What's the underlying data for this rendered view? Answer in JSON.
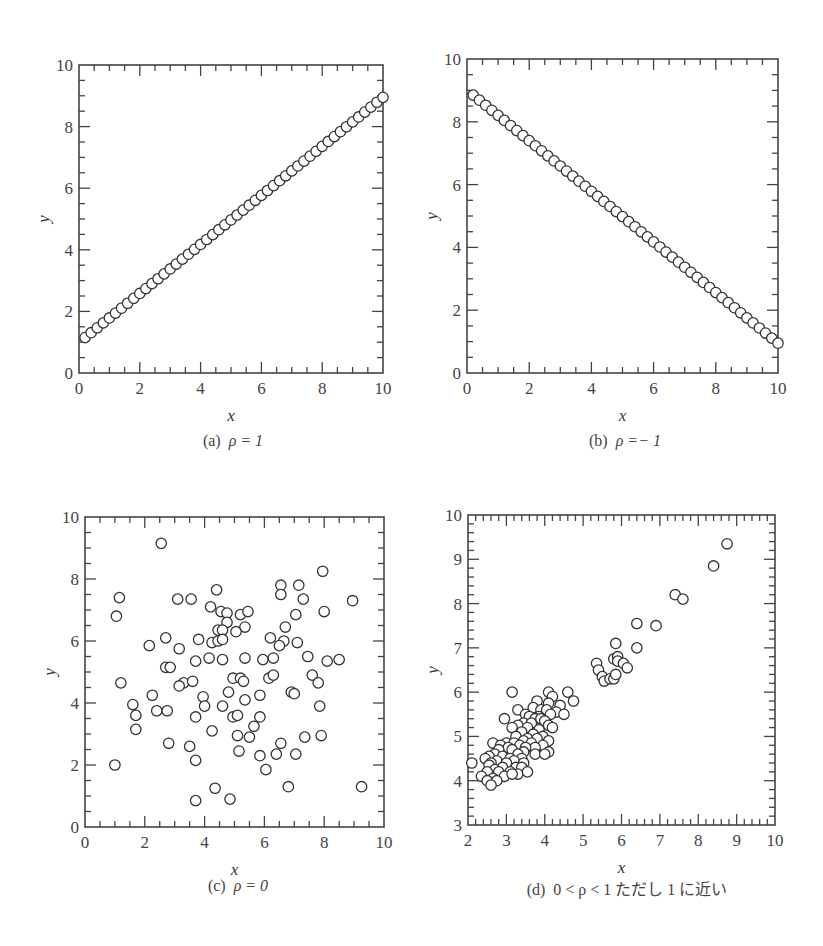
{
  "figure": {
    "panels": [
      {
        "id": "a",
        "caption_prefix": "(a)",
        "caption_math": "ρ = 1"
      },
      {
        "id": "b",
        "caption_prefix": "(b)",
        "caption_math": "ρ =− 1"
      },
      {
        "id": "c",
        "caption_prefix": "(c)",
        "caption_math": "ρ = 0"
      },
      {
        "id": "d",
        "caption_prefix": "(d)",
        "caption_math": "0 < ρ < 1  ただし 1 に近い"
      }
    ]
  },
  "style": {
    "frame_color": "#444444",
    "marker_stroke": "#333333",
    "marker_fill": "#ffffff",
    "text_color": "#444444"
  },
  "chart_data": [
    {
      "id": "a",
      "type": "scatter",
      "title": "(a) ρ = 1",
      "xlabel": "x",
      "ylabel": "y",
      "xlim": [
        0,
        10
      ],
      "ylim": [
        0,
        10
      ],
      "xticks": [
        0,
        2,
        4,
        6,
        8,
        10
      ],
      "yticks": [
        0,
        2,
        4,
        6,
        8,
        10
      ],
      "minor_step": 0.5,
      "grid": false,
      "frame": {
        "left": 79,
        "top": 65,
        "right": 383,
        "bottom": 373
      },
      "line_series": {
        "x_start": 0.2,
        "x_end": 10,
        "n": 50,
        "y_start": 1.15,
        "y_end": 8.95
      },
      "points": []
    },
    {
      "id": "b",
      "type": "scatter",
      "title": "(b) ρ = −1",
      "xlabel": "x",
      "ylabel": "y",
      "xlim": [
        0,
        10
      ],
      "ylim": [
        0,
        10
      ],
      "xticks": [
        0,
        2,
        4,
        6,
        8,
        10
      ],
      "yticks": [
        0,
        2,
        4,
        6,
        8,
        10
      ],
      "minor_step": 0.5,
      "grid": false,
      "frame": {
        "left": 467,
        "top": 59,
        "right": 778,
        "bottom": 373
      },
      "line_series": {
        "x_start": 0.2,
        "x_end": 10,
        "n": 50,
        "y_start": 8.85,
        "y_end": 0.95
      },
      "points": []
    },
    {
      "id": "c",
      "type": "scatter",
      "title": "(c) ρ = 0",
      "xlabel": "x",
      "ylabel": "y",
      "xlim": [
        0,
        10
      ],
      "ylim": [
        0,
        10
      ],
      "xticks": [
        0,
        2,
        4,
        6,
        8,
        10
      ],
      "yticks": [
        0,
        2,
        4,
        6,
        8,
        10
      ],
      "minor_step": 0.5,
      "grid": false,
      "frame": {
        "left": 85,
        "top": 517,
        "right": 384,
        "bottom": 827
      },
      "points": [
        [
          2.55,
          9.15
        ],
        [
          7.95,
          8.25
        ],
        [
          4.4,
          7.65
        ],
        [
          6.55,
          7.8
        ],
        [
          7.15,
          7.8
        ],
        [
          6.55,
          7.5
        ],
        [
          1.15,
          7.4
        ],
        [
          3.1,
          7.35
        ],
        [
          3.55,
          7.35
        ],
        [
          7.3,
          7.35
        ],
        [
          8.95,
          7.3
        ],
        [
          1.05,
          6.8
        ],
        [
          4.2,
          7.1
        ],
        [
          4.55,
          6.95
        ],
        [
          4.75,
          6.9
        ],
        [
          5.2,
          6.85
        ],
        [
          5.45,
          6.95
        ],
        [
          7.05,
          6.85
        ],
        [
          8.0,
          6.95
        ],
        [
          4.75,
          6.6
        ],
        [
          4.45,
          6.35
        ],
        [
          4.6,
          6.35
        ],
        [
          5.35,
          6.45
        ],
        [
          6.7,
          6.45
        ],
        [
          5.05,
          6.3
        ],
        [
          2.7,
          6.1
        ],
        [
          3.8,
          6.05
        ],
        [
          6.2,
          6.1
        ],
        [
          4.25,
          5.95
        ],
        [
          4.45,
          6.0
        ],
        [
          4.6,
          6.05
        ],
        [
          6.65,
          6.0
        ],
        [
          7.1,
          5.95
        ],
        [
          6.5,
          5.85
        ],
        [
          2.15,
          5.85
        ],
        [
          3.15,
          5.75
        ],
        [
          7.45,
          5.5
        ],
        [
          3.7,
          5.35
        ],
        [
          4.15,
          5.45
        ],
        [
          4.6,
          5.4
        ],
        [
          5.35,
          5.45
        ],
        [
          5.95,
          5.4
        ],
        [
          6.3,
          5.45
        ],
        [
          8.1,
          5.35
        ],
        [
          8.5,
          5.4
        ],
        [
          2.7,
          5.15
        ],
        [
          2.85,
          5.15
        ],
        [
          4.95,
          4.8
        ],
        [
          5.2,
          4.8
        ],
        [
          5.3,
          4.7
        ],
        [
          6.15,
          4.8
        ],
        [
          6.3,
          4.9
        ],
        [
          7.6,
          4.9
        ],
        [
          7.8,
          4.65
        ],
        [
          1.2,
          4.65
        ],
        [
          3.3,
          4.65
        ],
        [
          3.6,
          4.7
        ],
        [
          3.15,
          4.55
        ],
        [
          4.8,
          4.35
        ],
        [
          6.9,
          4.35
        ],
        [
          7.0,
          4.3
        ],
        [
          2.25,
          4.25
        ],
        [
          3.95,
          4.2
        ],
        [
          5.85,
          4.25
        ],
        [
          1.6,
          3.95
        ],
        [
          4.0,
          3.9
        ],
        [
          4.6,
          3.9
        ],
        [
          5.35,
          4.1
        ],
        [
          7.85,
          3.9
        ],
        [
          2.4,
          3.75
        ],
        [
          2.75,
          3.75
        ],
        [
          1.7,
          3.6
        ],
        [
          3.7,
          3.55
        ],
        [
          4.95,
          3.55
        ],
        [
          5.1,
          3.6
        ],
        [
          5.85,
          3.55
        ],
        [
          5.65,
          3.25
        ],
        [
          1.7,
          3.15
        ],
        [
          4.25,
          3.1
        ],
        [
          5.1,
          2.95
        ],
        [
          5.5,
          2.9
        ],
        [
          7.35,
          2.9
        ],
        [
          7.9,
          2.95
        ],
        [
          2.8,
          2.7
        ],
        [
          3.5,
          2.6
        ],
        [
          6.55,
          2.7
        ],
        [
          5.15,
          2.45
        ],
        [
          5.85,
          2.3
        ],
        [
          6.4,
          2.35
        ],
        [
          7.05,
          2.35
        ],
        [
          3.7,
          2.15
        ],
        [
          6.05,
          1.85
        ],
        [
          1.0,
          2.0
        ],
        [
          4.35,
          1.25
        ],
        [
          6.8,
          1.3
        ],
        [
          9.25,
          1.3
        ],
        [
          3.7,
          0.85
        ],
        [
          4.85,
          0.9
        ]
      ]
    },
    {
      "id": "d",
      "type": "scatter",
      "title": "(d) 0 < ρ < 1 ただし 1 に近い",
      "xlabel": "x",
      "ylabel": "y",
      "xlim": [
        2,
        10
      ],
      "ylim": [
        3,
        10
      ],
      "xticks": [
        2,
        3,
        4,
        5,
        6,
        7,
        8,
        9,
        10
      ],
      "yticks": [
        3,
        4,
        5,
        6,
        7,
        8,
        9,
        10
      ],
      "minor_step": 0.2,
      "grid": false,
      "frame": {
        "left": 468,
        "top": 515,
        "right": 775,
        "bottom": 825
      },
      "points": [
        [
          8.75,
          9.35
        ],
        [
          8.4,
          8.85
        ],
        [
          7.4,
          8.2
        ],
        [
          7.6,
          8.1
        ],
        [
          6.4,
          7.55
        ],
        [
          6.9,
          7.5
        ],
        [
          5.85,
          7.1
        ],
        [
          6.4,
          7.0
        ],
        [
          5.35,
          6.65
        ],
        [
          5.8,
          6.75
        ],
        [
          5.9,
          6.8
        ],
        [
          5.9,
          6.7
        ],
        [
          6.05,
          6.65
        ],
        [
          6.15,
          6.55
        ],
        [
          5.4,
          6.5
        ],
        [
          5.5,
          6.35
        ],
        [
          5.55,
          6.25
        ],
        [
          5.7,
          6.3
        ],
        [
          5.8,
          6.3
        ],
        [
          5.85,
          6.4
        ],
        [
          3.15,
          6.0
        ],
        [
          4.1,
          6.0
        ],
        [
          4.6,
          6.0
        ],
        [
          4.2,
          5.9
        ],
        [
          4.75,
          5.8
        ],
        [
          3.8,
          5.8
        ],
        [
          3.3,
          5.6
        ],
        [
          4.1,
          5.75
        ],
        [
          4.4,
          5.7
        ],
        [
          3.7,
          5.65
        ],
        [
          3.9,
          5.6
        ],
        [
          4.05,
          5.6
        ],
        [
          4.3,
          5.55
        ],
        [
          4.5,
          5.5
        ],
        [
          3.85,
          5.45
        ],
        [
          4.15,
          5.5
        ],
        [
          3.5,
          5.5
        ],
        [
          3.6,
          5.45
        ],
        [
          2.95,
          5.4
        ],
        [
          3.75,
          5.4
        ],
        [
          3.9,
          5.4
        ],
        [
          4.0,
          5.35
        ],
        [
          3.45,
          5.3
        ],
        [
          3.65,
          5.3
        ],
        [
          3.3,
          5.25
        ],
        [
          4.1,
          5.25
        ],
        [
          4.2,
          5.2
        ],
        [
          3.15,
          5.2
        ],
        [
          3.55,
          5.2
        ],
        [
          3.85,
          5.15
        ],
        [
          3.4,
          5.1
        ],
        [
          3.7,
          5.05
        ],
        [
          3.95,
          5.0
        ],
        [
          3.25,
          5.0
        ],
        [
          3.55,
          4.95
        ],
        [
          3.8,
          4.95
        ],
        [
          3.45,
          4.9
        ],
        [
          4.1,
          4.9
        ],
        [
          3.0,
          4.85
        ],
        [
          3.2,
          4.85
        ],
        [
          3.65,
          4.85
        ],
        [
          3.95,
          4.8
        ],
        [
          2.65,
          4.85
        ],
        [
          2.85,
          4.8
        ],
        [
          3.35,
          4.8
        ],
        [
          3.75,
          4.75
        ],
        [
          3.5,
          4.75
        ],
        [
          3.05,
          4.75
        ],
        [
          2.8,
          4.7
        ],
        [
          3.15,
          4.7
        ],
        [
          3.45,
          4.65
        ],
        [
          4.1,
          4.65
        ],
        [
          2.7,
          4.6
        ],
        [
          3.3,
          4.6
        ],
        [
          3.75,
          4.6
        ],
        [
          4.0,
          4.6
        ],
        [
          2.55,
          4.55
        ],
        [
          2.9,
          4.55
        ],
        [
          3.1,
          4.5
        ],
        [
          3.4,
          4.5
        ],
        [
          2.45,
          4.5
        ],
        [
          2.75,
          4.45
        ],
        [
          3.2,
          4.45
        ],
        [
          2.6,
          4.4
        ],
        [
          3.0,
          4.4
        ],
        [
          3.45,
          4.4
        ],
        [
          2.1,
          4.4
        ],
        [
          2.55,
          4.35
        ],
        [
          2.9,
          4.3
        ],
        [
          3.25,
          4.3
        ],
        [
          3.4,
          4.3
        ],
        [
          2.7,
          4.25
        ],
        [
          3.1,
          4.2
        ],
        [
          2.5,
          4.2
        ],
        [
          2.8,
          4.2
        ],
        [
          3.3,
          4.15
        ],
        [
          3.55,
          4.2
        ],
        [
          2.95,
          4.1
        ],
        [
          2.35,
          4.1
        ],
        [
          2.65,
          4.05
        ],
        [
          3.15,
          4.15
        ],
        [
          2.5,
          4.0
        ],
        [
          2.75,
          4.0
        ],
        [
          2.6,
          3.9
        ]
      ]
    }
  ]
}
